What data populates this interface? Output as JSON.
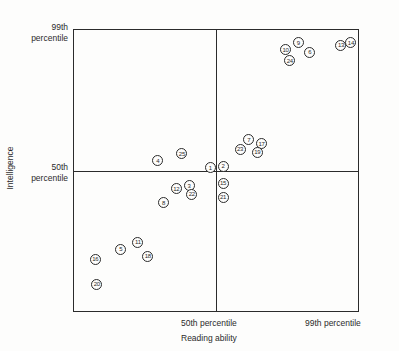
{
  "chart_data": {
    "type": "scatter",
    "title": "",
    "xlabel": "Reading ability",
    "ylabel": "Intelligence",
    "xticks": [
      {
        "label": "50th percentile",
        "value": 50
      },
      {
        "label": "99th percentile",
        "value": 99
      }
    ],
    "yticks": [
      {
        "label_line1": "99th",
        "label_line2": "percentile",
        "value": 99
      },
      {
        "label_line1": "50th",
        "label_line2": "percentile",
        "value": 50
      }
    ],
    "xlim": [
      0,
      100
    ],
    "ylim": [
      0,
      100
    ],
    "grid": false,
    "legend": null,
    "reference_lines": {
      "vertical_at": 50,
      "horizontal_at": 50
    },
    "marker": "circled-number",
    "annotations": [],
    "points": [
      {
        "label": "1",
        "x": 48.0,
        "y": 51.0
      },
      {
        "label": "2",
        "x": 52.5,
        "y": 51.5
      },
      {
        "label": "3",
        "x": 40.5,
        "y": 44.5
      },
      {
        "label": "4",
        "x": 29.5,
        "y": 53.5
      },
      {
        "label": "5",
        "x": 16.5,
        "y": 22.0
      },
      {
        "label": "6",
        "x": 83.0,
        "y": 92.0
      },
      {
        "label": "7",
        "x": 61.5,
        "y": 61.0
      },
      {
        "label": "8",
        "x": 31.5,
        "y": 38.5
      },
      {
        "label": "9",
        "x": 79.0,
        "y": 95.5
      },
      {
        "label": "10",
        "x": 74.5,
        "y": 93.0
      },
      {
        "label": "11",
        "x": 22.5,
        "y": 24.5
      },
      {
        "label": "12",
        "x": 36.0,
        "y": 43.5
      },
      {
        "label": "13",
        "x": 94.0,
        "y": 94.5
      },
      {
        "label": "14",
        "x": 97.5,
        "y": 95.5
      },
      {
        "label": "15",
        "x": 52.5,
        "y": 45.5
      },
      {
        "label": "16",
        "x": 7.5,
        "y": 18.5
      },
      {
        "label": "17",
        "x": 66.0,
        "y": 59.5
      },
      {
        "label": "18",
        "x": 26.0,
        "y": 19.5
      },
      {
        "label": "19",
        "x": 64.5,
        "y": 56.5
      },
      {
        "label": "20",
        "x": 8.0,
        "y": 9.5
      },
      {
        "label": "21",
        "x": 52.5,
        "y": 40.5
      },
      {
        "label": "22",
        "x": 41.5,
        "y": 41.5
      },
      {
        "label": "23",
        "x": 58.5,
        "y": 57.5
      },
      {
        "label": "24",
        "x": 76.0,
        "y": 89.0
      },
      {
        "label": "25",
        "x": 38.0,
        "y": 56.0
      }
    ]
  },
  "colors": {
    "ink": "#2b2b2b",
    "background": "#fdfdfc"
  }
}
